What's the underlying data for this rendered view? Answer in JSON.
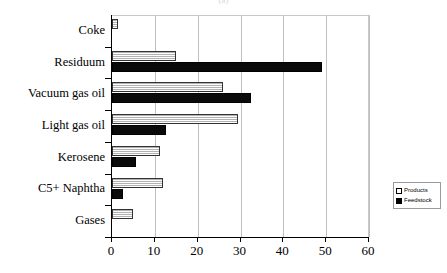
{
  "chart_data": {
    "type": "bar",
    "orientation": "horizontal",
    "title": "(a)",
    "xlabel": "",
    "ylabel": "",
    "xlim": [
      0,
      60
    ],
    "xticks": [
      0,
      10,
      20,
      30,
      40,
      50,
      60
    ],
    "xtick_labels": [
      "0",
      "10",
      "20",
      "30",
      "40",
      "50",
      "60"
    ],
    "grid": true,
    "grid_axis": "x",
    "legend_position": "right",
    "categories": [
      "Coke",
      "Residuum",
      "Vacuum gas oil",
      "Light gas oil",
      "Kerosene",
      "C5+ Naphtha",
      "Gases"
    ],
    "series": [
      {
        "name": "Products",
        "color": "#d4d4d4",
        "values": [
          1.5,
          15,
          26,
          29.5,
          11.3,
          12,
          5
        ]
      },
      {
        "name": "Feedstock",
        "color": "#000000",
        "values": [
          0,
          49,
          32.5,
          12.5,
          5.5,
          2.5,
          0
        ]
      }
    ]
  },
  "legend": {
    "entries": [
      {
        "label": "Products",
        "swatch": "products-swatch-icon"
      },
      {
        "label": "Feedstock",
        "swatch": "feedstock-swatch-icon"
      }
    ]
  }
}
